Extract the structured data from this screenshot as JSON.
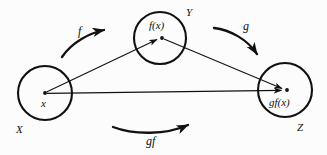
{
  "diagram": {
    "background_color": "#fcfcfc",
    "stroke_color": "#111111",
    "sets": [
      {
        "id": "domain",
        "set_label": "X",
        "element_label": "x",
        "cx": 45,
        "cy": 93,
        "r": 27
      },
      {
        "id": "codomain-intermediate",
        "set_label": "Y",
        "element_label": "f(x)",
        "cx": 160,
        "cy": 38,
        "r": 26
      },
      {
        "id": "codomain-final",
        "set_label": "Z",
        "element_label": "gf(x)",
        "cx": 285,
        "cy": 90,
        "r": 27
      }
    ],
    "maps": [
      {
        "id": "map-f",
        "label": "f",
        "from": "X",
        "to": "Y",
        "direction": "up-right"
      },
      {
        "id": "map-g",
        "label": "g",
        "from": "Y",
        "to": "Z",
        "direction": "down-right"
      },
      {
        "id": "map-gf",
        "label": "gf",
        "from": "X",
        "to": "Z",
        "direction": "right"
      }
    ],
    "element_arrows": [
      {
        "id": "arrow-x-to-fx",
        "from": "x",
        "to": "f(x)"
      },
      {
        "id": "arrow-fx-to-gfx",
        "from": "f(x)",
        "to": "gf(x)"
      },
      {
        "id": "arrow-x-to-gfx",
        "from": "x",
        "to": "gf(x)"
      }
    ]
  }
}
